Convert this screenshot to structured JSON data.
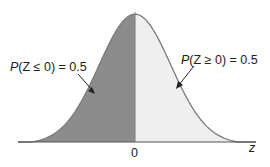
{
  "chart_data": {
    "type": "area",
    "title": "",
    "xlabel": "z",
    "ylabel": "",
    "x_ticks": [
      "0"
    ],
    "distribution": "standard normal",
    "regions": [
      {
        "name": "left",
        "range": "z <= 0",
        "probability": 0.5,
        "label": "P(Z ≤ 0) = 0.5",
        "color": "#8c8c8c"
      },
      {
        "name": "right",
        "range": "z >= 0",
        "probability": 0.5,
        "label": "P(Z ≥ 0) = 0.5",
        "color": "#efefef"
      }
    ],
    "grid": false,
    "legend": "none"
  },
  "labels": {
    "left_prefix": "P",
    "left_rest": "(Z ≤ 0) = 0.5",
    "right_prefix": "P",
    "right_rest": "(Z ≥ 0) = 0.5",
    "zero": "0",
    "axis": "z"
  },
  "colors": {
    "left_fill": "#8c8c8c",
    "right_fill": "#efefef",
    "curve": "#7a7a7a",
    "axis": "#555555"
  }
}
